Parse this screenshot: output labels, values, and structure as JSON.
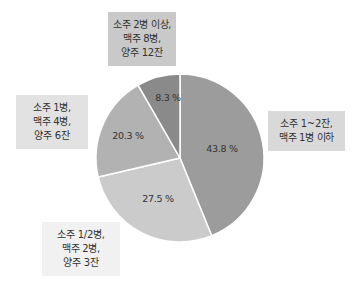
{
  "chart_data": {
    "type": "pie",
    "title": "",
    "start_angle_deg": 0,
    "direction": "clockwise",
    "slices": [
      {
        "label": "소주 1~2잔, 맥주 1병 이하",
        "value": 43.8,
        "display": "43.8 %",
        "color": "#9c9c9c"
      },
      {
        "label": "소주 1/2병, 맥주 2병, 양주 3잔",
        "value": 27.5,
        "display": "27.5 %",
        "color": "#cbcbcb"
      },
      {
        "label": "소주 1병, 맥주 4병, 양주 6잔",
        "value": 20.3,
        "display": "20.3 %",
        "color": "#b2b2b2"
      },
      {
        "label": "소주 2병 이상, 맥주 8병, 양주 12잔",
        "value": 8.3,
        "display": "8.3 %",
        "color": "#8a8a8a"
      }
    ],
    "legend": "callout boxes next to each slice"
  },
  "callouts": {
    "top": {
      "lines": [
        "소주 2병 이상,",
        "맥주 8병,",
        "양주 12잔"
      ],
      "bg": "#c9c9c9"
    },
    "left": {
      "lines": [
        "소주 1병,",
        "맥주 4병,",
        "양주 6잔"
      ],
      "bg": "#e2e2e2"
    },
    "bottom": {
      "lines": [
        "소주 1/2병,",
        "맥주 2병,",
        "양주 3잔"
      ],
      "bg": "#f1f1f1"
    },
    "right": {
      "lines": [
        "소주 1~2잔,",
        "맥주 1병 이하"
      ],
      "bg": "#d9d9d9"
    }
  }
}
